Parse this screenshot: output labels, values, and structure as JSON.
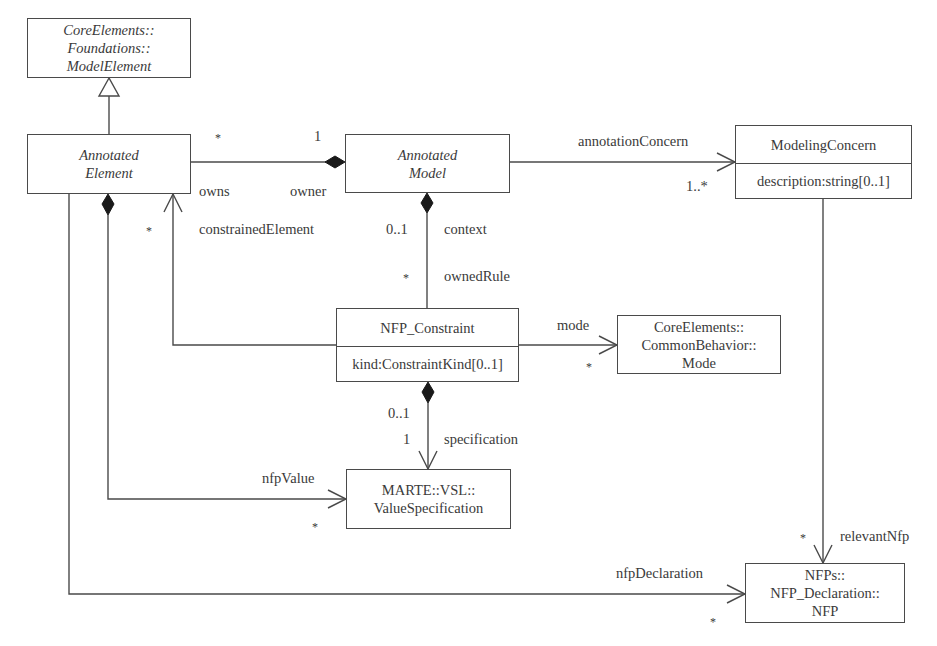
{
  "classes": {
    "model_element": {
      "lines": [
        "CoreElements::",
        "Foundations::",
        "ModelElement"
      ],
      "italic": true
    },
    "annotated_element": {
      "lines": [
        "Annotated",
        "Element"
      ],
      "italic": true
    },
    "annotated_model": {
      "lines": [
        "Annotated",
        "Model"
      ],
      "italic": true
    },
    "modeling_concern": {
      "name": "ModelingConcern",
      "attribute": "description:string[0..1]"
    },
    "nfp_constraint": {
      "name": "NFP_Constraint",
      "attribute": "kind:ConstraintKind[0..1]"
    },
    "mode": {
      "lines": [
        "CoreElements::",
        "CommonBehavior::",
        "Mode"
      ]
    },
    "value_specification": {
      "lines": [
        "MARTE::VSL::",
        "ValueSpecification"
      ]
    },
    "nfp": {
      "lines": [
        "NFPs::",
        "NFP_Declaration::",
        "NFP"
      ]
    }
  },
  "associations": {
    "owns": {
      "source_mult": "*",
      "target_mult": "1",
      "source_role": "owns",
      "target_role": "owner"
    },
    "annotation_concern": {
      "role": "annotationConcern",
      "mult": "1..*"
    },
    "constrained_element": {
      "role": "constrainedElement",
      "mult": "*"
    },
    "context": {
      "role": "context",
      "mult": "0..1"
    },
    "owned_rule": {
      "role": "ownedRule",
      "mult": "*"
    },
    "mode": {
      "role": "mode",
      "mult": "*"
    },
    "specification": {
      "role": "specification",
      "source_mult": "0..1",
      "target_mult": "1"
    },
    "nfp_value": {
      "role": "nfpValue",
      "mult": "*"
    },
    "relevant_nfp": {
      "role": "relevantNfp",
      "mult": "*"
    },
    "nfp_declaration": {
      "role": "nfpDeclaration",
      "mult": "*"
    }
  }
}
